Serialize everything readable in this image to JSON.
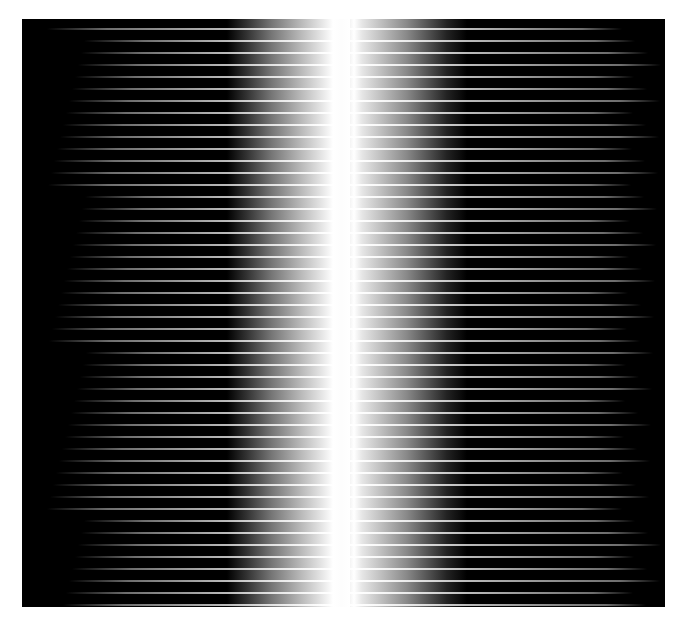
{
  "figure": {
    "streak_count": 49,
    "streak_pitch_px": 12,
    "colors": {
      "background": "#000000",
      "center_band": "#ffffff",
      "page": "#ffffff"
    }
  }
}
